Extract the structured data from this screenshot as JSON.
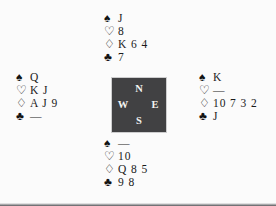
{
  "diagram": {
    "type": "bridge-deal",
    "background_color": "#fbfbfb",
    "compass_box_color": "#414143",
    "suit_symbols": {
      "spade": "♠",
      "heart": "♡",
      "diamond": "♢",
      "club": "♣"
    },
    "void_marker": "—"
  },
  "compass": {
    "north": "N",
    "west": "W",
    "east": "E",
    "south": "S"
  },
  "hands": {
    "north": {
      "label": "North",
      "spades": "J",
      "hearts": "8",
      "diamonds": "K 6 4",
      "clubs": "7"
    },
    "west": {
      "label": "West",
      "spades": "Q",
      "hearts": "K J",
      "diamonds": "A J 9",
      "clubs": "—"
    },
    "east": {
      "label": "East",
      "spades": "K",
      "hearts": "—",
      "diamonds": "10 7 3 2",
      "clubs": "J"
    },
    "south": {
      "label": "South",
      "spades": "—",
      "hearts": "10",
      "diamonds": "Q 8 5",
      "clubs": "9 8"
    }
  }
}
